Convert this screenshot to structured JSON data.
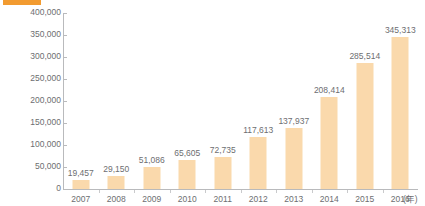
{
  "header": {
    "swatch_color": "#f29b30",
    "title": "",
    "title_color": "#e8e8ec"
  },
  "colors": {
    "bar": "#fad9ac",
    "accent": "#f29b30",
    "text": "#6d6e71",
    "axis": "#b9babc",
    "background": "#ffffff"
  },
  "chart_data": {
    "type": "bar",
    "title": "",
    "xlabel": "(年)",
    "ylabel": "",
    "categories": [
      "2007",
      "2008",
      "2009",
      "2010",
      "2011",
      "2012",
      "2013",
      "2014",
      "2015",
      "2016"
    ],
    "values": [
      19457,
      29150,
      51086,
      65605,
      72735,
      117613,
      137937,
      208414,
      285514,
      345313
    ],
    "value_labels": [
      "19,457",
      "29,150",
      "51,086",
      "65,605",
      "72,735",
      "117,613",
      "137,937",
      "208,414",
      "285,514",
      "345,313"
    ],
    "ylim": [
      0,
      400000
    ],
    "ytick_values": [
      0,
      50000,
      100000,
      150000,
      200000,
      250000,
      300000,
      350000,
      400000
    ],
    "ytick_labels": [
      "0",
      "50,000",
      "100,000",
      "150,000",
      "200,000",
      "250,000",
      "300,000",
      "350,000",
      "400,000"
    ],
    "grid": false,
    "legend": false,
    "series": [
      {
        "name": "",
        "values": [
          19457,
          29150,
          51086,
          65605,
          72735,
          117613,
          137937,
          208414,
          285514,
          345313
        ]
      }
    ]
  }
}
